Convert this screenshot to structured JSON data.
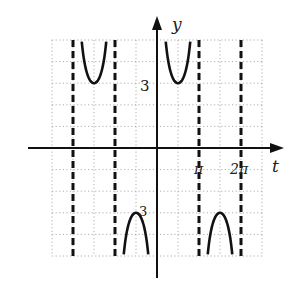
{
  "chart_data": {
    "type": "line",
    "title": "",
    "function": "y = 3 csc t",
    "xlabel": "t",
    "ylabel": "y",
    "tick_labels": {
      "x": [
        "π",
        "2π"
      ],
      "y": [
        "3",
        "-3"
      ]
    },
    "x_unit_per_grid": "π/2",
    "y_unit_per_grid": 1,
    "xlim": [
      "-5π/2",
      "5π/2"
    ],
    "ylim": [
      -5,
      5
    ],
    "grid": true,
    "asymptotes": [
      "-2π",
      "-π",
      "π",
      "2π"
    ],
    "branches": [
      {
        "interval": [
          "-2π",
          "-π"
        ],
        "extremum": {
          "t": "-3π/2",
          "y": 3
        },
        "direction": "up"
      },
      {
        "interval": [
          "-π",
          "0"
        ],
        "extremum": {
          "t": "-π/2",
          "y": -3
        },
        "direction": "down"
      },
      {
        "interval": [
          "0",
          "π"
        ],
        "extremum": {
          "t": "π/2",
          "y": 3
        },
        "direction": "up"
      },
      {
        "interval": [
          "π",
          "2π"
        ],
        "extremum": {
          "t": "3π/2",
          "y": -3
        },
        "direction": "down"
      }
    ]
  },
  "labels": {
    "x_axis": "t",
    "y_axis": "y",
    "pi": "π",
    "two_pi": "2π",
    "three": "3",
    "neg_three": "3"
  }
}
